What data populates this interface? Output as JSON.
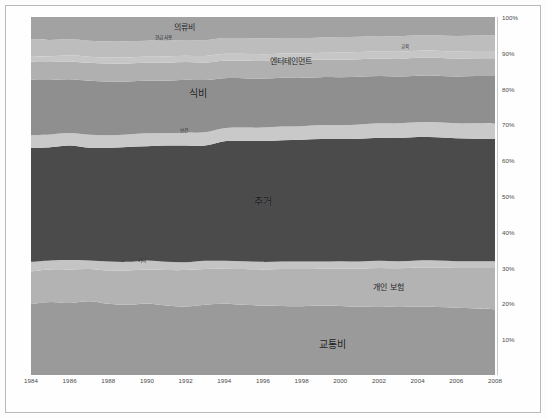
{
  "chart_data": {
    "type": "area",
    "title": "",
    "subtitle": "",
    "xlabel": "",
    "ylabel": "",
    "stacked": true,
    "normalized": true,
    "grid": false,
    "legend_position": "inline-labels",
    "xlim": [
      1984,
      2008
    ],
    "ylim": [
      0,
      100
    ],
    "x": [
      1984,
      1985,
      1986,
      1987,
      1988,
      1989,
      1990,
      1991,
      1992,
      1993,
      1994,
      1995,
      1996,
      1997,
      1998,
      1999,
      2000,
      2001,
      2002,
      2003,
      2004,
      2005,
      2006,
      2007,
      2008
    ],
    "xticks": [
      "1984",
      "1986",
      "1988",
      "1990",
      "1992",
      "1994",
      "1996",
      "1998",
      "2000",
      "2002",
      "2004",
      "2006",
      "2008"
    ],
    "yticks": [
      "10%",
      "20%",
      "30%",
      "40%",
      "50%",
      "60%",
      "70%",
      "80%",
      "90%",
      "100%"
    ],
    "series": [
      {
        "name": "교통비",
        "label": "교통비",
        "label_size": "lg",
        "color": "#9a9a9a",
        "label_x_pct": 65.0,
        "label_y_pct": 9.0,
        "values": [
          19.8,
          20.4,
          20.1,
          20.6,
          19.9,
          19.6,
          20.0,
          19.4,
          19.1,
          19.6,
          19.9,
          19.6,
          19.4,
          19.3,
          19.2,
          19.4,
          19.3,
          19.1,
          19.2,
          19.0,
          19.1,
          19.0,
          18.8,
          18.6,
          18.4
        ]
      },
      {
        "name": "개인 보험",
        "label": "개인 보험",
        "label_size": "md",
        "color": "#b3b3b3",
        "label_x_pct": 77.0,
        "label_y_pct": 25.0,
        "values": [
          9.2,
          9.1,
          9.4,
          9.0,
          9.3,
          9.6,
          9.5,
          9.9,
          10.2,
          10.0,
          9.8,
          10.0,
          10.1,
          10.3,
          10.4,
          10.3,
          10.4,
          10.6,
          10.7,
          10.8,
          10.9,
          11.0,
          11.1,
          11.3,
          11.5
        ]
      },
      {
        "name": "기타",
        "label": "기타",
        "label_size": "sm",
        "color": "#c4c4c4",
        "label_x_pct": 24.0,
        "label_y_pct": 32.0,
        "values": [
          2.6,
          2.5,
          2.6,
          2.4,
          2.5,
          2.4,
          2.5,
          2.3,
          2.2,
          2.3,
          2.2,
          2.2,
          2.1,
          2.1,
          2.1,
          2.0,
          2.1,
          2.0,
          2.0,
          2.0,
          2.0,
          2.0,
          1.9,
          1.9,
          1.9
        ]
      },
      {
        "name": "주거",
        "label": "주거",
        "label_size": "lg",
        "color": "#4b4b4b",
        "label_x_pct": 50.0,
        "label_y_pct": 49.0,
        "values": [
          31.8,
          31.6,
          32.0,
          31.5,
          31.8,
          32.1,
          31.9,
          32.5,
          32.6,
          32.2,
          33.4,
          33.6,
          33.8,
          33.9,
          34.0,
          34.2,
          34.1,
          34.3,
          34.4,
          34.4,
          34.5,
          34.4,
          34.3,
          34.2,
          34.1
        ]
      },
      {
        "name": "보건",
        "label": "보건",
        "label_size": "sm",
        "color": "#c9c9c9",
        "label_x_pct": 33.0,
        "label_y_pct": 68.5,
        "values": [
          3.6,
          3.6,
          3.5,
          3.6,
          3.5,
          3.5,
          3.6,
          3.5,
          3.6,
          3.7,
          3.6,
          3.7,
          3.7,
          3.8,
          3.8,
          3.9,
          3.9,
          4.0,
          4.0,
          4.1,
          4.1,
          4.2,
          4.2,
          4.3,
          4.3
        ]
      },
      {
        "name": "식비",
        "label": "식비",
        "label_size": "lg",
        "color": "#8f8f8f",
        "label_x_pct": 36.0,
        "label_y_pct": 79.0,
        "values": [
          15.5,
          15.2,
          15.0,
          15.1,
          15.0,
          14.8,
          14.7,
          14.6,
          14.8,
          14.6,
          14.0,
          13.8,
          13.7,
          13.6,
          13.5,
          13.4,
          13.4,
          13.3,
          13.2,
          13.1,
          13.0,
          13.0,
          13.1,
          13.2,
          13.3
        ]
      },
      {
        "name": "엔터테인먼트",
        "label": "엔터테인먼트",
        "label_size": "md",
        "color": "#b0b0b0",
        "label_x_pct": 56.0,
        "label_y_pct": 88.0,
        "values": [
          5.0,
          5.0,
          5.0,
          5.0,
          5.0,
          5.0,
          5.0,
          5.0,
          4.9,
          4.9,
          4.9,
          4.9,
          4.9,
          4.9,
          4.9,
          4.9,
          4.9,
          4.9,
          4.9,
          4.9,
          5.0,
          5.0,
          5.0,
          5.0,
          5.0
        ]
      },
      {
        "name": "교육",
        "label": "교육",
        "label_size": "sm",
        "color": "#c6c6c6",
        "label_x_pct": 80.5,
        "label_y_pct": 92.0,
        "values": [
          1.6,
          1.6,
          1.7,
          1.7,
          1.7,
          1.7,
          1.8,
          1.8,
          1.8,
          1.8,
          1.9,
          1.9,
          1.9,
          1.9,
          1.9,
          1.9,
          2.0,
          2.0,
          2.0,
          2.0,
          2.0,
          2.0,
          2.0,
          2.0,
          2.0
        ]
      },
      {
        "name": "현금 사용",
        "label": "현금 사용",
        "label_size": "sm",
        "color": "#bdbdbd",
        "label_x_pct": 28.5,
        "label_y_pct": 94.5,
        "values": [
          4.6,
          4.6,
          4.5,
          4.5,
          4.5,
          4.5,
          4.4,
          4.4,
          4.4,
          4.4,
          4.4,
          4.4,
          4.4,
          4.3,
          4.3,
          4.3,
          4.3,
          4.3,
          4.3,
          4.3,
          4.3,
          4.3,
          4.3,
          4.3,
          4.3
        ]
      },
      {
        "name": "의류비",
        "label": "의류비",
        "label_size": "md",
        "color": "#a2a2a2",
        "label_x_pct": 33.0,
        "label_y_pct": 97.5,
        "values": [
          6.3,
          6.4,
          6.2,
          6.6,
          6.8,
          6.8,
          6.6,
          6.6,
          6.4,
          6.5,
          5.9,
          5.9,
          6.0,
          5.9,
          5.9,
          5.7,
          5.6,
          5.5,
          5.3,
          5.4,
          5.1,
          5.1,
          5.3,
          5.2,
          5.2
        ]
      }
    ]
  },
  "figure": {
    "background": "#fefefe",
    "axis_text_color": "#4a4a4a",
    "border_color": "#b9b9b9"
  }
}
